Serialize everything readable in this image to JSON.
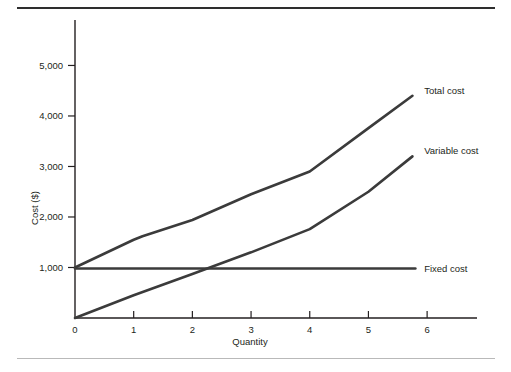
{
  "figure": {
    "background_color": "#ffffff",
    "line_color": "#3b3b3b",
    "axis_color": "#231f20",
    "top_rule_color": "#2e2e2e",
    "bottom_rule_color": "#b9b9b9"
  },
  "chart_data": {
    "type": "line",
    "title": "",
    "xlabel": "Quantity",
    "ylabel": "Cost ($)",
    "xlim": [
      0,
      6.85
    ],
    "ylim": [
      0,
      5900
    ],
    "xticks": [
      0,
      1,
      2,
      3,
      4,
      5,
      6
    ],
    "xtick_labels": [
      "0",
      "1",
      "2",
      "3",
      "4",
      "5",
      "6"
    ],
    "yticks": [
      1000,
      2000,
      3000,
      4000,
      5000
    ],
    "ytick_labels": [
      "1,000",
      "2,000",
      "3,000",
      "4,000",
      "5,000"
    ],
    "grid": false,
    "legend_position": "right-of-line-ends",
    "series": [
      {
        "name": "Total cost",
        "label": "Total cost",
        "color": "#3b3b3b",
        "x": [
          0,
          1.0,
          1.15,
          2.0,
          3.0,
          4.0,
          5.0,
          5.75
        ],
        "values": [
          1000,
          1550,
          1620,
          1940,
          2450,
          2900,
          3760,
          4400
        ]
      },
      {
        "name": "Variable cost",
        "label": "Variable cost",
        "color": "#3b3b3b",
        "x": [
          0,
          1.0,
          2.0,
          3.0,
          4.0,
          5.0,
          5.75
        ],
        "values": [
          0,
          450,
          870,
          1300,
          1760,
          2500,
          3200
        ]
      },
      {
        "name": "Fixed cost",
        "label": "Fixed cost",
        "color": "#3b3b3b",
        "x": [
          0,
          5.8
        ],
        "values": [
          980,
          980
        ]
      }
    ],
    "annotations": [
      {
        "text": "Total cost",
        "x": 5.95,
        "y": 4500
      },
      {
        "text": "Variable cost",
        "x": 5.95,
        "y": 3320
      },
      {
        "text": "Fixed cost",
        "x": 5.95,
        "y": 980
      }
    ]
  }
}
